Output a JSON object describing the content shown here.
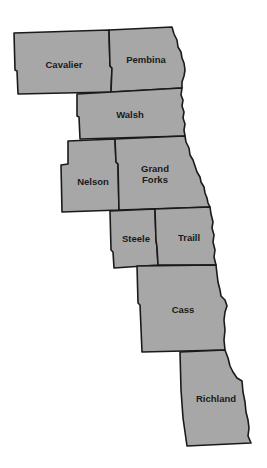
{
  "map": {
    "type": "county map",
    "region": "Eastern North Dakota (Red River Valley)",
    "fill_color": "#a7a7a7",
    "border_color": "#1a1a1a",
    "background_color": "#ffffff",
    "counties": [
      {
        "name": "Cavalier",
        "label_lines": [
          "Cavalier"
        ]
      },
      {
        "name": "Pembina",
        "label_lines": [
          "Pembina"
        ]
      },
      {
        "name": "Walsh",
        "label_lines": [
          "Walsh"
        ]
      },
      {
        "name": "Nelson",
        "label_lines": [
          "Nelson"
        ]
      },
      {
        "name": "Grand Forks",
        "label_lines": [
          "Grand",
          "Forks"
        ]
      },
      {
        "name": "Steele",
        "label_lines": [
          "Steele"
        ]
      },
      {
        "name": "Traill",
        "label_lines": [
          "Traill"
        ]
      },
      {
        "name": "Cass",
        "label_lines": [
          "Cass"
        ]
      },
      {
        "name": "Richland",
        "label_lines": [
          "Richland"
        ]
      }
    ]
  }
}
